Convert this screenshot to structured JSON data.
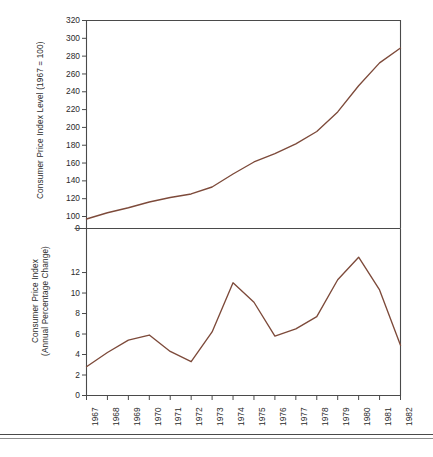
{
  "figure": {
    "line_color": "#7d4a3a",
    "axis_color": "#4a4a4a",
    "background": "#ffffff"
  },
  "chart_data": [
    {
      "type": "line",
      "id": "cpi-level",
      "title": "",
      "xlabel": "",
      "ylabel": "Consumer Price Index Level (1967 = 100)",
      "categories": [
        "1967",
        "1968",
        "1969",
        "1970",
        "1971",
        "1972",
        "1973",
        "1974",
        "1975",
        "1976",
        "1977",
        "1978",
        "1979",
        "1980",
        "1981",
        "1982"
      ],
      "values": [
        97.2,
        104.2,
        109.8,
        116.3,
        121.3,
        125.3,
        133.1,
        147.7,
        161.2,
        170.5,
        181.5,
        195.4,
        217.4,
        246.8,
        272.4,
        289.1
      ],
      "series": [
        {
          "name": "Consumer Price Index Level",
          "values": [
            97.2,
            104.2,
            109.8,
            116.3,
            121.3,
            125.3,
            133.1,
            147.7,
            161.2,
            170.5,
            181.5,
            195.4,
            217.4,
            246.8,
            272.4,
            289.1
          ]
        }
      ],
      "ytick_labels": [
        "0",
        "100",
        "120",
        "140",
        "160",
        "180",
        "200",
        "220",
        "240",
        "260",
        "280",
        "300",
        "320"
      ],
      "ytick_values": [
        0,
        100,
        120,
        140,
        160,
        180,
        200,
        220,
        240,
        260,
        280,
        300,
        320
      ],
      "ylim": [
        0,
        320
      ],
      "grid": false,
      "legend": "none"
    },
    {
      "type": "line",
      "id": "cpi-annual-change",
      "title": "",
      "xlabel": "",
      "ylabel": "Consumer Price Index\n(Annual Percentage Change)",
      "categories": [
        "1967",
        "1968",
        "1969",
        "1970",
        "1971",
        "1972",
        "1973",
        "1974",
        "1975",
        "1976",
        "1977",
        "1978",
        "1979",
        "1980",
        "1981",
        "1982"
      ],
      "values": [
        2.8,
        4.2,
        5.4,
        5.9,
        4.3,
        3.3,
        6.2,
        11.0,
        9.1,
        5.8,
        6.5,
        7.7,
        11.3,
        13.5,
        10.3,
        4.9
      ],
      "series": [
        {
          "name": "Consumer Price Index (Annual Percentage Change)",
          "values": [
            2.8,
            4.2,
            5.4,
            5.9,
            4.3,
            3.3,
            6.2,
            11.0,
            9.1,
            5.8,
            6.5,
            7.7,
            11.3,
            13.5,
            10.3,
            4.9
          ]
        }
      ],
      "ytick_labels": [
        "0",
        "2",
        "4",
        "6",
        "8",
        "10",
        "12"
      ],
      "ytick_values": [
        0,
        2,
        4,
        6,
        8,
        10,
        12
      ],
      "ylim": [
        0,
        14.2
      ],
      "grid": false,
      "legend": "none"
    }
  ]
}
